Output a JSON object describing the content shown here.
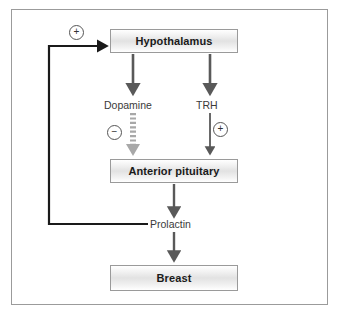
{
  "diagram": {
    "colors": {
      "frame_border": "#9b9b9b",
      "box_border": "#9a9a9a",
      "arrow_dark": "#595959",
      "arrow_light": "#a8a8a8",
      "feedback_line": "#1a1a1a",
      "text": "#1a1a1a"
    },
    "nodes": [
      {
        "id": "hypothalamus",
        "label": "Hypothalamus"
      },
      {
        "id": "anterior_pituitary",
        "label": "Anterior pituitary"
      },
      {
        "id": "breast",
        "label": "Breast"
      }
    ],
    "mediators": [
      {
        "id": "dopamine",
        "label": "Dopamine",
        "effect": "-",
        "sign_glyph": "−"
      },
      {
        "id": "trh",
        "label": "TRH",
        "effect": "+",
        "sign_glyph": "+"
      },
      {
        "id": "prolactin",
        "label": "Prolactin"
      }
    ],
    "feedback": {
      "from": "Prolactin",
      "to": "Hypothalamus",
      "effect": "+",
      "sign_glyph": "+"
    },
    "edges": [
      {
        "from": "Hypothalamus",
        "to": "Dopamine",
        "style": "solid-dark"
      },
      {
        "from": "Hypothalamus",
        "to": "TRH",
        "style": "solid-dark"
      },
      {
        "from": "Dopamine",
        "to": "Anterior pituitary",
        "style": "dashed-light",
        "sign": "−"
      },
      {
        "from": "TRH",
        "to": "Anterior pituitary",
        "style": "solid-dark",
        "sign": "+"
      },
      {
        "from": "Anterior pituitary",
        "to": "Prolactin",
        "style": "solid-dark"
      },
      {
        "from": "Prolactin",
        "to": "Breast",
        "style": "solid-dark"
      },
      {
        "from": "Prolactin",
        "to": "Hypothalamus",
        "style": "feedback-black",
        "sign": "+"
      }
    ]
  }
}
